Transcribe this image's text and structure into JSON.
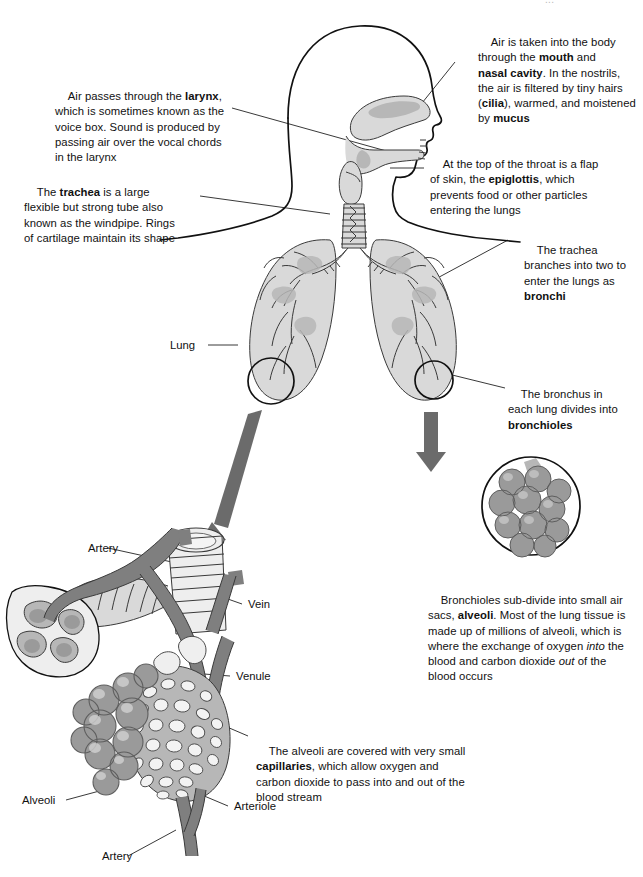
{
  "diagram": {
    "title_clipped": "..."
  },
  "notes": [
    {
      "id": "note-mouth-nasal",
      "segments": [
        {
          "t": "Air is taken into the body",
          "s": "n"
        },
        {
          "t": "through the ",
          "s": "n"
        },
        {
          "t": "mouth",
          "s": "b"
        },
        {
          "t": " and ",
          "s": "n"
        },
        {
          "t": "nasal cavity",
          "s": "b"
        },
        {
          "t": ". In the nostrils, the air is filtered by tiny hairs (",
          "s": "n"
        },
        {
          "t": "cilia",
          "s": "b"
        },
        {
          "t": "), warmed, and moistened by ",
          "s": "n"
        },
        {
          "t": "mucus",
          "s": "b"
        }
      ],
      "plain": "Air is taken into the body through the mouth and nasal cavity. In the nostrils, the air is filtered by tiny hairs (cilia), warmed, and moistened by mucus"
    },
    {
      "id": "note-larynx",
      "segments": [
        {
          "t": "Air passes through the ",
          "s": "n"
        },
        {
          "t": "larynx",
          "s": "b"
        },
        {
          "t": ", which is sometimes known as the voice box. Sound is produced by passing air over the vocal chords in the larynx",
          "s": "n"
        }
      ],
      "plain": "Air passes through the larynx, which is sometimes known as the voice box. Sound is produced by passing air over the vocal chords in the larynx"
    },
    {
      "id": "note-epiglottis",
      "segments": [
        {
          "t": "At the top of the throat is a flap of skin, the ",
          "s": "n"
        },
        {
          "t": "epiglottis",
          "s": "b"
        },
        {
          "t": ", which prevents food or other particles entering the lungs",
          "s": "n"
        }
      ],
      "plain": "At the top of the throat is a flap of skin, the epiglottis, which prevents food or other particles entering the lungs"
    },
    {
      "id": "note-trachea",
      "segments": [
        {
          "t": "The ",
          "s": "n"
        },
        {
          "t": "trachea",
          "s": "b"
        },
        {
          "t": " is a large flexible but strong tube also known as the windpipe. Rings of cartilage maintain its shape",
          "s": "n"
        }
      ],
      "plain": "The trachea is a large flexible but strong tube also known as the windpipe. Rings of cartilage maintain its shape"
    },
    {
      "id": "note-bronchi",
      "segments": [
        {
          "t": "The trachea branches into two to enter the lungs as ",
          "s": "n"
        },
        {
          "t": "bronchi",
          "s": "b"
        }
      ],
      "plain": "The trachea branches into two to enter the lungs as bronchi"
    },
    {
      "id": "note-bronchioles",
      "segments": [
        {
          "t": "The bronchus in each lung divides into ",
          "s": "n"
        },
        {
          "t": "bronchioles",
          "s": "b"
        }
      ],
      "plain": "The bronchus in each lung divides into bronchioles"
    },
    {
      "id": "note-alveoli",
      "segments": [
        {
          "t": "Bronchioles sub-divide into small air sacs, ",
          "s": "n"
        },
        {
          "t": "alveoli",
          "s": "b"
        },
        {
          "t": ". Most of the lung tissue is made up of millions of alveoli, which is where the exchange of oxygen ",
          "s": "n"
        },
        {
          "t": "into",
          "s": "i"
        },
        {
          "t": " the blood and carbon dioxide ",
          "s": "n"
        },
        {
          "t": "out",
          "s": "i"
        },
        {
          "t": " of the blood occurs",
          "s": "n"
        }
      ],
      "plain": "Bronchioles sub-divide into small air sacs, alveoli. Most of the lung tissue is made up of millions of alveoli, which is where the exchange of oxygen into the blood and carbon dioxide out of the blood occurs"
    },
    {
      "id": "note-capillaries",
      "segments": [
        {
          "t": "The alveoli are covered with very small ",
          "s": "n"
        },
        {
          "t": "capillaries",
          "s": "b"
        },
        {
          "t": ", which allow oxygen and carbon dioxide to pass into and out of the blood stream",
          "s": "n"
        }
      ],
      "plain": "The alveoli are covered with very small capillaries, which allow oxygen and carbon dioxide to pass into and out of the blood stream"
    }
  ],
  "labels": {
    "lung": "Lung",
    "artery_top": "Artery",
    "vein": "Vein",
    "venule": "Venule",
    "alveoli": "Alveoli",
    "arteriole": "Arteriole",
    "artery_bottom": "Artery"
  },
  "colors": {
    "text": "#111111",
    "leader_line": "#222222",
    "outline": "#111111",
    "arrow_gray": "#6b6b6b",
    "tissue_light": "#d9d9d9",
    "tissue_mid": "#b7b7b7",
    "tissue_dark": "#9a9a9a"
  }
}
